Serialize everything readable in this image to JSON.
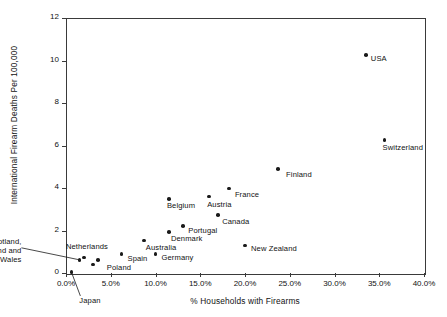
{
  "chart_data": {
    "type": "scatter",
    "title": "",
    "xlabel": "% Households with Firearms",
    "ylabel": "International Firearm Deaths Per 100,000",
    "xlim": [
      0,
      40
    ],
    "ylim": [
      0,
      12
    ],
    "xtick_labels": [
      "0.0%",
      "5.0%",
      "10.0%",
      "15.0%",
      "20.0%",
      "25.0%",
      "30.0%",
      "35.0%",
      "40.0%"
    ],
    "xtick_values": [
      0,
      5,
      10,
      15,
      20,
      25,
      30,
      35,
      40
    ],
    "ytick_labels": [
      "0",
      "2",
      "4",
      "6",
      "8",
      "10",
      "12"
    ],
    "ytick_values": [
      0,
      2,
      4,
      6,
      8,
      10,
      12
    ],
    "grid": false,
    "legend": false,
    "marker_color": "#1a1a1a",
    "axis_color": "#3a3a3a",
    "points": [
      {
        "label": "Japan",
        "x": 0.6,
        "y": 0.05,
        "label_dx": 8,
        "label_dy": 28,
        "leader": true,
        "anchor": "left"
      },
      {
        "label": "Scotland, England and Wales",
        "x": 1.5,
        "y": 0.62,
        "label_dx": -58,
        "label_dy": -14,
        "leader": true,
        "anchor": "right"
      },
      {
        "label": "Netherlands",
        "x": 2.0,
        "y": 0.72,
        "label_dx": -18,
        "label_dy": -12,
        "leader": false,
        "anchor": "left"
      },
      {
        "label": "Poland",
        "x": 3.0,
        "y": 0.4,
        "label_dx": 14,
        "label_dy": 2,
        "leader": false,
        "anchor": "left"
      },
      {
        "label": "",
        "x": 3.6,
        "y": 0.62,
        "label_dx": 0,
        "label_dy": 0,
        "leader": false,
        "anchor": "left"
      },
      {
        "label": "Spain",
        "x": 6.2,
        "y": 0.9,
        "label_dx": 6,
        "label_dy": 4,
        "leader": false,
        "anchor": "left"
      },
      {
        "label": "Australia",
        "x": 8.7,
        "y": 1.52,
        "label_dx": 2,
        "label_dy": 6,
        "leader": false,
        "anchor": "left"
      },
      {
        "label": "Germany",
        "x": 10.0,
        "y": 0.9,
        "label_dx": 6,
        "label_dy": 3,
        "leader": false,
        "anchor": "left"
      },
      {
        "label": "Denmark",
        "x": 11.5,
        "y": 1.92,
        "label_dx": 2,
        "label_dy": 6,
        "leader": false,
        "anchor": "left"
      },
      {
        "label": "Belgium",
        "x": 11.5,
        "y": 3.48,
        "label_dx": -2,
        "label_dy": 6,
        "leader": false,
        "anchor": "left"
      },
      {
        "label": "Portugal",
        "x": 13.1,
        "y": 2.22,
        "label_dx": 5,
        "label_dy": 4,
        "leader": false,
        "anchor": "left"
      },
      {
        "label": "Austria",
        "x": 16.0,
        "y": 3.6,
        "label_dx": -2,
        "label_dy": 7,
        "leader": false,
        "anchor": "left"
      },
      {
        "label": "Canada",
        "x": 17.0,
        "y": 2.72,
        "label_dx": 4,
        "label_dy": 6,
        "leader": false,
        "anchor": "left"
      },
      {
        "label": "France",
        "x": 18.2,
        "y": 3.98,
        "label_dx": 6,
        "label_dy": 6,
        "leader": false,
        "anchor": "left"
      },
      {
        "label": "New Zealand",
        "x": 20.0,
        "y": 1.3,
        "label_dx": 6,
        "label_dy": 3,
        "leader": false,
        "anchor": "left"
      },
      {
        "label": "Finland",
        "x": 23.7,
        "y": 4.9,
        "label_dx": 8,
        "label_dy": 5,
        "leader": false,
        "anchor": "left"
      },
      {
        "label": "USA",
        "x": 33.5,
        "y": 10.25,
        "label_dx": 5,
        "label_dy": 3,
        "leader": false,
        "anchor": "left"
      },
      {
        "label": "Switzerland",
        "x": 35.6,
        "y": 6.25,
        "label_dx": -2,
        "label_dy": 7,
        "leader": false,
        "anchor": "left"
      }
    ]
  }
}
